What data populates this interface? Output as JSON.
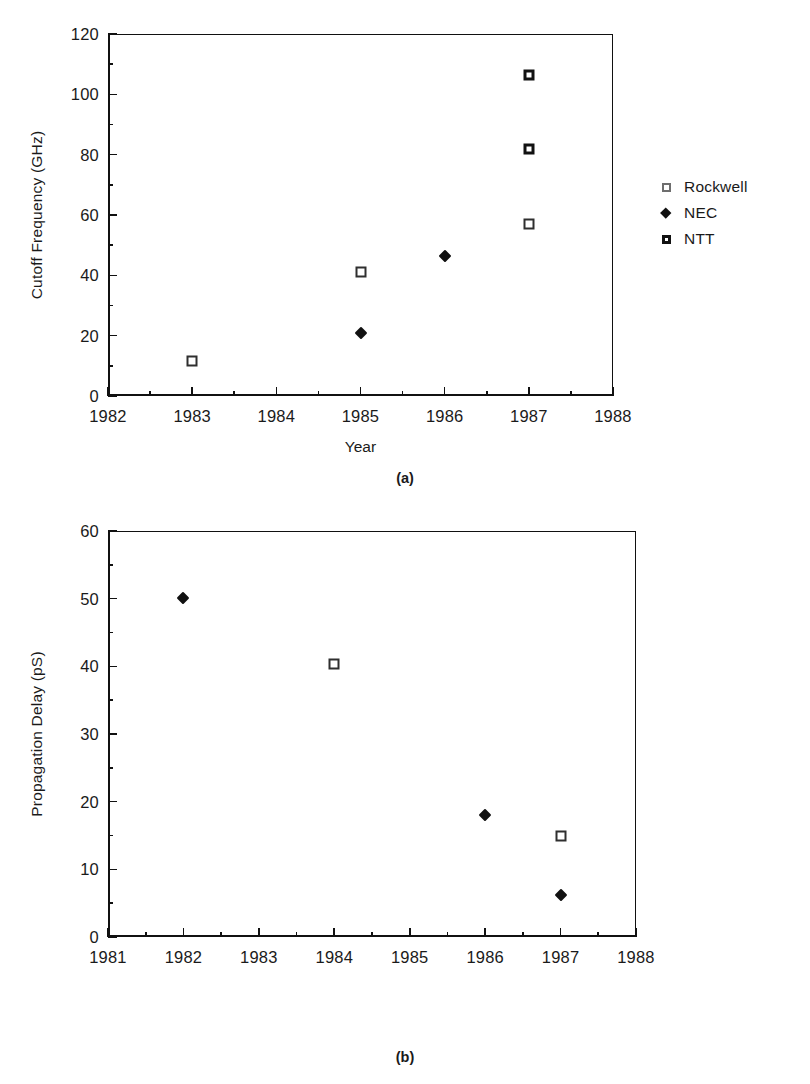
{
  "figures": [
    {
      "id": "a",
      "caption": "(a)",
      "legend": [
        {
          "label": "Rockwell",
          "marker": "open-square"
        },
        {
          "label": "NEC",
          "marker": "filled-diamond"
        },
        {
          "label": "NTT",
          "marker": "filled-square"
        }
      ]
    },
    {
      "id": "b",
      "caption": "(b)",
      "legend": [
        {
          "label": "Rockwell",
          "marker": "open-square"
        },
        {
          "label": "NTT",
          "marker": "filled-diamond"
        }
      ]
    }
  ],
  "chart_data": [
    {
      "type": "scatter",
      "panel": "(a)",
      "title": "",
      "xlabel": "Year",
      "ylabel": "Cutoff Frequency (GHz)",
      "xlim": [
        1982,
        1988
      ],
      "ylim": [
        0,
        120
      ],
      "xticks": [
        1982,
        1983,
        1984,
        1985,
        1986,
        1987,
        1988
      ],
      "xtick_labels": [
        "1982",
        "1983",
        "1984",
        "1985",
        "1986",
        "1987",
        "1988"
      ],
      "xminor_step": 0.5,
      "yticks": [
        0,
        20,
        40,
        60,
        80,
        100,
        120
      ],
      "ytick_labels": [
        "0",
        "20",
        "40",
        "60",
        "80",
        "100",
        "120"
      ],
      "yminor_step": 10,
      "grid": false,
      "legend_position": "right",
      "series": [
        {
          "name": "Rockwell",
          "marker": "open-square",
          "points": [
            {
              "x": 1983,
              "y": 11.5
            },
            {
              "x": 1985,
              "y": 41
            },
            {
              "x": 1987,
              "y": 57
            }
          ]
        },
        {
          "name": "NEC",
          "marker": "filled-diamond",
          "points": [
            {
              "x": 1985,
              "y": 21
            },
            {
              "x": 1986,
              "y": 46.5
            }
          ]
        },
        {
          "name": "NTT",
          "marker": "filled-square",
          "points": [
            {
              "x": 1987,
              "y": 82
            },
            {
              "x": 1987,
              "y": 106.5
            }
          ]
        }
      ]
    },
    {
      "type": "scatter",
      "panel": "(b)",
      "title": "",
      "xlabel": "",
      "ylabel": "Propagation Delay (pS)",
      "xlim": [
        1981,
        1988
      ],
      "ylim": [
        0,
        60
      ],
      "xticks": [
        1981,
        1982,
        1983,
        1984,
        1985,
        1986,
        1987,
        1988
      ],
      "xtick_labels": [
        "1981",
        "1982",
        "1983",
        "1984",
        "1985",
        "1986",
        "1987",
        "1988"
      ],
      "xminor_step": 0.5,
      "yticks": [
        0,
        10,
        20,
        30,
        40,
        50,
        60
      ],
      "ytick_labels": [
        "0",
        "10",
        "20",
        "30",
        "40",
        "50",
        "60"
      ],
      "yminor_step": 5,
      "grid": false,
      "legend_position": "right",
      "series": [
        {
          "name": "Rockwell",
          "marker": "open-square",
          "points": [
            {
              "x": 1984,
              "y": 40.4
            },
            {
              "x": 1987,
              "y": 15
            }
          ]
        },
        {
          "name": "NTT",
          "marker": "filled-diamond",
          "points": [
            {
              "x": 1982,
              "y": 50.1
            },
            {
              "x": 1986,
              "y": 18
            },
            {
              "x": 1987,
              "y": 6.2
            }
          ]
        }
      ]
    }
  ]
}
